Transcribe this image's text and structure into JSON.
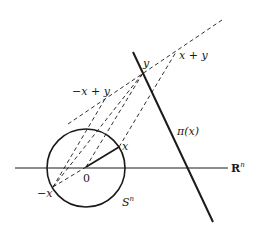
{
  "diagram": {
    "type": "geometric construction",
    "labels": {
      "origin": "0",
      "x": "x",
      "neg_x": "−x",
      "y": "y",
      "x_plus_y": "x + y",
      "neg_x_plus_y": "−x + y",
      "pi_x": "π(x)",
      "rn_base": "R",
      "rn_sup": "n",
      "sn_base": "S",
      "sn_sup": "n"
    },
    "points": {
      "origin": [
        86,
        167
      ],
      "x": [
        119,
        147
      ],
      "neg_x": [
        53,
        187
      ],
      "y": [
        143,
        73
      ],
      "x_plus_y": [
        176,
        52
      ],
      "neg_x_plus_y": [
        105,
        99
      ]
    },
    "circle": {
      "cx": 86,
      "cy": 168,
      "r": 39
    },
    "colors": {
      "stroke": "#1a1a1a",
      "background": "#ffffff"
    }
  }
}
